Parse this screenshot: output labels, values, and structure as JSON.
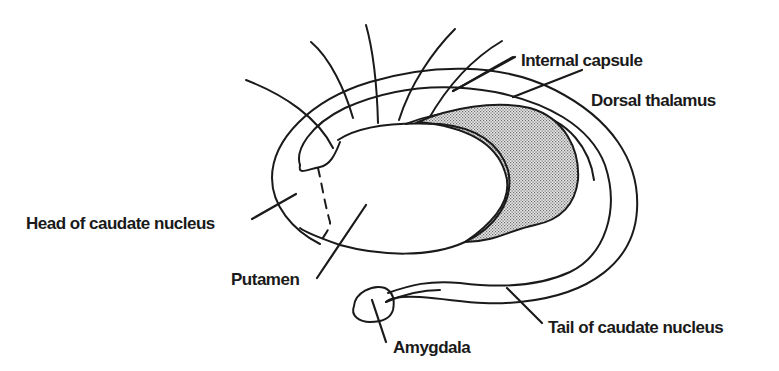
{
  "figure": {
    "colors": {
      "line": "#1a1a1a",
      "background": "#ffffff",
      "thalamus_fill_dot": "#6e6e6e",
      "thalamus_fill_bg": "#e4e4e4"
    }
  },
  "labels": {
    "internal_capsule": "Internal capsule",
    "dorsal_thalamus": "Dorsal thalamus",
    "head_of_caudate": "Head of caudate nucleus",
    "putamen": "Putamen",
    "amygdala": "Amygdala",
    "tail_of_caudate": "Tail of caudate nucleus"
  }
}
